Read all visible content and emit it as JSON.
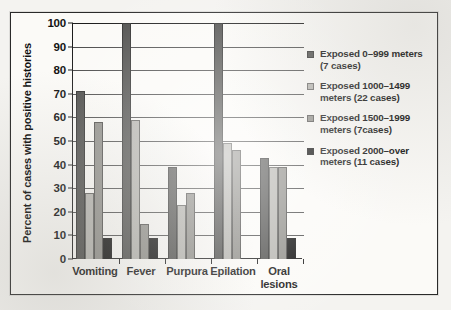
{
  "chart_data": {
    "type": "bar",
    "title": "",
    "subtitle": "",
    "xlabel": "",
    "ylabel": "Percent of cases with positive histories",
    "ylim": [
      0,
      100
    ],
    "ytick_step": 10,
    "yticks": [
      100,
      90,
      80,
      70,
      60,
      50,
      40,
      30,
      20,
      10,
      0
    ],
    "grid": true,
    "legend_position": "right",
    "categories": [
      "Vomiting",
      "Fever",
      "Purpura",
      "Epilation",
      "Oral lesions"
    ],
    "series": [
      {
        "name": "Exposed 0–999 meters (7 cases)",
        "color": "#4e4e4c",
        "values": [
          71,
          100,
          39,
          100,
          43
        ]
      },
      {
        "name": "Exposed 1000–1499 meters (22 cases)",
        "color": "#b4b3ae",
        "values": [
          28,
          59,
          23,
          49,
          39
        ]
      },
      {
        "name": "Exposed 1500–1999 meters (7cases)",
        "color": "#8e8d88",
        "values": [
          58,
          15,
          28,
          46,
          39
        ]
      },
      {
        "name": "Exposed 2000–over meters (11 cases)",
        "color": "#0d0d0d",
        "values": [
          9,
          9,
          0,
          0,
          9
        ]
      }
    ]
  },
  "legend": {
    "entries": [
      {
        "line1": "Exposed 0–999 meters",
        "line2": "(7 cases)",
        "color": "#4e4e4c",
        "swatch_name": "legend-swatch-exposed-0-999"
      },
      {
        "line1": "Exposed 1000–1499",
        "line2": "meters (22 cases)",
        "color": "#b4b3ae",
        "swatch_name": "legend-swatch-exposed-1000-1499"
      },
      {
        "line1": "Exposed 1500–1999",
        "line2": "meters (7cases)",
        "color": "#8e8d88",
        "swatch_name": "legend-swatch-exposed-1500-1999"
      },
      {
        "line1": "Exposed 2000–over",
        "line2": "meters (11 cases)",
        "color": "#0d0d0d",
        "swatch_name": "legend-swatch-exposed-2000-over"
      }
    ]
  },
  "axis": {
    "y_title": "Percent of cases with positive histories",
    "x_labels": [
      {
        "line1": "Vomiting",
        "line2": ""
      },
      {
        "line1": "Fever",
        "line2": ""
      },
      {
        "line1": "Purpura",
        "line2": ""
      },
      {
        "line1": "Epilation",
        "line2": ""
      },
      {
        "line1": "Oral",
        "line2": "lesions"
      }
    ]
  }
}
